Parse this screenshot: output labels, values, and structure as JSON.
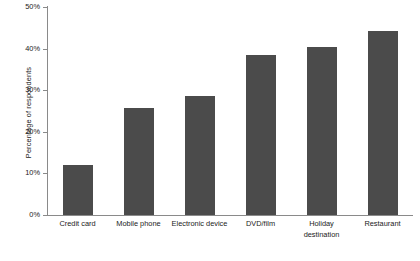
{
  "chart_data": {
    "type": "bar",
    "title": "",
    "xlabel": "",
    "ylabel": "Percentage of respondents",
    "categories": [
      "Credit card",
      "Mobile phone",
      "Electronic device",
      "DVD/film",
      "Holiday destination",
      "Restaurant"
    ],
    "values": [
      12.0,
      25.8,
      28.5,
      38.5,
      40.5,
      44.3
    ],
    "ylim": [
      0,
      50
    ],
    "yticks": [
      0,
      10,
      20,
      30,
      40,
      50
    ],
    "ytick_labels": [
      "0%",
      "10%",
      "20%",
      "30%",
      "40%",
      "50%"
    ],
    "grid": false,
    "legend": false,
    "bar_color": "#4b4b4b",
    "axis_color": "#8a8a8a",
    "background_color": "#ffffff"
  }
}
